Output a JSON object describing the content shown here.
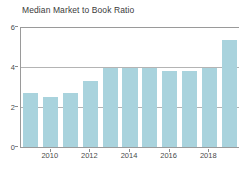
{
  "chart_data": {
    "type": "bar",
    "title": "Median Market to Book Ratio",
    "xlabel": "",
    "ylabel": "",
    "categories": [
      "2009",
      "2010",
      "2011",
      "2012",
      "2013",
      "2014",
      "2015",
      "2016",
      "2017",
      "2018",
      "2019"
    ],
    "values": [
      2.75,
      2.55,
      2.75,
      3.35,
      4.0,
      4.0,
      4.0,
      3.85,
      3.85,
      4.0,
      5.4
    ],
    "ylim": [
      0,
      6
    ],
    "yticks": [
      0,
      2,
      4,
      6
    ],
    "ytick_labels": [
      "0",
      "2",
      "4",
      "6"
    ],
    "xticks_shown": [
      "2010",
      "2012",
      "2014",
      "2016",
      "2018"
    ],
    "grid": true,
    "legend": "none",
    "bar_color": "#a9d3dd",
    "axis_color": "#9a9a9a",
    "grid_color": "#b4b4b4",
    "text_color": "#3a3a3a",
    "background": "#ffffff"
  }
}
